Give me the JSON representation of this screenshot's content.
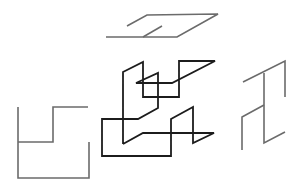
{
  "figure": {
    "colors": {
      "main_stroke": "#1c1c1c",
      "projection_stroke": "#6b6b6b",
      "background": "#ffffff"
    },
    "views": [
      {
        "name": "top-projection",
        "paths": [
          "M127,26 L147,15 L218,14 L177,37 L106,37",
          "M143,37 L162,26"
        ]
      },
      {
        "name": "front-projection",
        "paths": [
          "M18,107 L18,178 L89,178 L89,142",
          "M18,142 L53,142 L53,107 L88,107"
        ]
      },
      {
        "name": "side-projection",
        "paths": [
          "M243,82 L285,61 L285,97",
          "M264,73 L264,143 L285,132",
          "M242,150 L242,117 L264,105"
        ]
      },
      {
        "name": "wire-object",
        "paths": [
          "M123,144 L123,72 L143,62 L143,97 L179,97 L179,61 L215,61 L172,83 L136,83 L158,73 L158,108 L138,119 L102,119 L102,156 L171,156 L171,119 L193,107 L193,143 L214,133 L143,133 L123,144"
        ]
      }
    ]
  }
}
